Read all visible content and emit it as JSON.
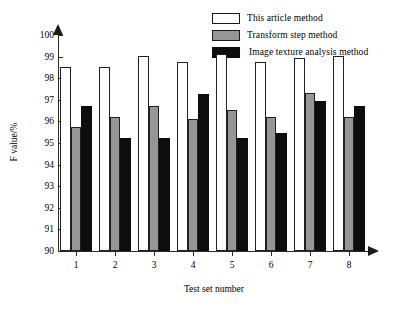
{
  "chart_data": {
    "type": "bar",
    "title": "",
    "xlabel": "Test set number",
    "ylabel": "F value/%",
    "categories": [
      "1",
      "2",
      "3",
      "4",
      "5",
      "6",
      "7",
      "8"
    ],
    "ylim": [
      90,
      100
    ],
    "yticks": [
      90,
      91,
      92,
      93,
      94,
      95,
      96,
      97,
      98,
      99,
      100
    ],
    "ytick_labels": [
      "90",
      "91",
      "92",
      "93",
      "94",
      "95",
      "96",
      "97",
      "98",
      "99",
      "100"
    ],
    "grid": false,
    "legend_position": "top-right",
    "series": [
      {
        "name": "This article method",
        "color": "#ffffff",
        "values": [
          98.52,
          98.52,
          99.02,
          98.73,
          99.12,
          98.73,
          98.93,
          99.02
        ]
      },
      {
        "name": "Transform step method",
        "color": "#969696",
        "values": [
          95.73,
          96.22,
          96.73,
          96.12,
          96.52,
          96.22,
          97.32,
          96.22
        ]
      },
      {
        "name": "Image texture analysis method",
        "color": "#0d0d0d",
        "values": [
          96.73,
          95.25,
          95.25,
          97.25,
          95.25,
          95.45,
          96.95,
          96.73
        ]
      }
    ]
  },
  "legend": {
    "items": [
      {
        "label": "This article method",
        "swatch": "white-swatch"
      },
      {
        "label": "Transform step method",
        "swatch": "gray-swatch"
      },
      {
        "label": "Image texture analysis method",
        "swatch": "black-swatch"
      }
    ]
  },
  "axes": {
    "y_title": "F value/%",
    "x_title": "Test set number"
  }
}
